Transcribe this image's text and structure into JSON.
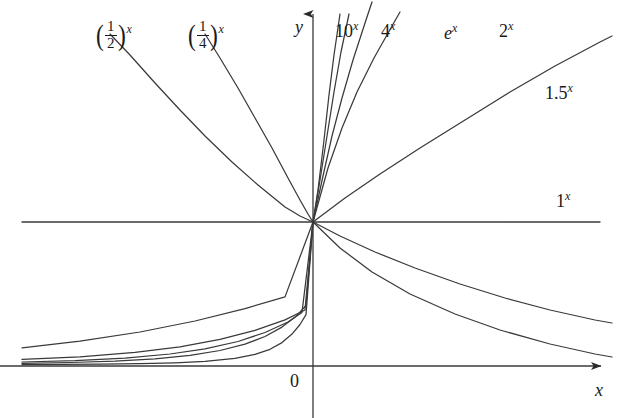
{
  "figure": {
    "title": "",
    "background": "#ffffff",
    "curve_color": "#3a3a3a",
    "axis_color": "#3a3a3a",
    "text_color": "#1a1a1a"
  },
  "axes": {
    "x_axis_label": "x",
    "y_axis_label": "y",
    "origin_label": "0",
    "origin_px": {
      "x": 313,
      "y": 222
    },
    "x_axis_y_px": 366,
    "y_axis_x_px": 313,
    "x_axis_arrow_tip_px": 601,
    "y_axis_arrow_tip_px": 14
  },
  "labels": {
    "half": {
      "base_num": "1",
      "base_den": "2",
      "exponent": "x"
    },
    "quarter": {
      "base_num": "1",
      "base_den": "4",
      "exponent": "x"
    },
    "ten": {
      "base": "10",
      "exponent": "x"
    },
    "four": {
      "base": "4",
      "exponent": "x"
    },
    "e": {
      "base": "e",
      "exponent": "x"
    },
    "two": {
      "base": "2",
      "exponent": "x"
    },
    "onefive": {
      "base": "1.5",
      "exponent": "x"
    },
    "one": {
      "base": "1",
      "exponent": "x"
    }
  },
  "chart_data": {
    "type": "line",
    "title": "",
    "xlabel": "x",
    "ylabel": "y",
    "grid": false,
    "legend": "inline-curve-labels",
    "xlim": [
      -3.1,
      3.1
    ],
    "ylim": [
      -0.25,
      6.5
    ],
    "passes_through": {
      "x": 0,
      "y": 1
    },
    "series": [
      {
        "name": "(1/2)^x",
        "base": 0.5,
        "kind": "decay",
        "label": "(1/2)^x",
        "label_px": {
          "x": 95,
          "y": 22
        }
      },
      {
        "name": "(1/4)^x",
        "base": 0.25,
        "kind": "decay",
        "label": "(1/4)^x",
        "label_px": {
          "x": 187,
          "y": 22
        }
      },
      {
        "name": "10^x",
        "base": 10,
        "kind": "growth",
        "label": "10^x",
        "label_px": {
          "x": 335,
          "y": 22
        }
      },
      {
        "name": "4^x",
        "base": 4,
        "kind": "growth",
        "label": "4^x",
        "label_px": {
          "x": 381,
          "y": 22
        }
      },
      {
        "name": "e^x",
        "base": 2.718281828,
        "kind": "growth",
        "label": "e^x",
        "label_px": {
          "x": 444,
          "y": 22
        }
      },
      {
        "name": "2^x",
        "base": 2,
        "kind": "growth",
        "label": "2^x",
        "label_px": {
          "x": 499,
          "y": 22
        }
      },
      {
        "name": "1.5^x",
        "base": 1.5,
        "kind": "growth",
        "label": "1.5^x",
        "label_px": {
          "x": 545,
          "y": 84
        }
      },
      {
        "name": "1^x",
        "base": 1,
        "kind": "constant",
        "label": "1^x",
        "label_px": {
          "x": 556,
          "y": 192
        }
      }
    ],
    "curve_paths": {
      "ten": "M 22,364.6 L 60,364.4 L 100,364.2 L 140,363.7 L 175,362.8 L 205,361.4 L 235,358.3 L 255,354.4 L 270,349.3 L 282,342.6 L 292,334.1 L 300,324.5 L 306,314.6 L 313,222 L 318,190 L 324,140 L 329,95 L 334,55 L 340,14",
      "four": "M 22,363.3 L 70,362.5 L 115,361.2 L 155,358.9 L 190,355.4 L 220,350.5 L 245,344.2 L 265,336.5 L 282,327.1 L 296,316.3 L 306,305.5 L 313,222 L 320,180 L 327,136 L 334,92 L 341,52 L 349,14",
      "e": "M 22,362.0 L 75,360.6 L 125,358.1 L 170,354.0 L 205,348.8 L 238,341.5 L 265,332.5 L 288,322.0 L 302,312.4 L 313,222 L 323,176 L 332,136 L 342,98 L 353,60 L 366,20 L 372,2",
      "two": "M 22,359.4 L 80,356.8 L 135,352.4 L 180,346.8 L 220,339.4 L 255,330.3 L 285,319.9 L 305,310.0 L 313,222 L 328,168 L 342,128 L 357,92 L 374,58 L 392,26 L 400,12",
      "onefive": "M 22,347.8 L 80,341.2 L 140,332.0 L 195,321.0 L 245,308.6 L 285,296.9 L 313,222 L 345,198 L 380,174 L 420,148 L 465,120 L 510,92 L 555,66 L 600,42 L 612,36",
      "one": "M 22,222 L 313,222 L 600,222",
      "half": "M 110,34 L 130,55 L 155,83 L 180,110 L 205,136 L 232,162 L 258,185 L 285,207 L 300,216 L 313,222 L 340,236 L 375,252 L 415,268 L 460,284 L 505,298 L 550,310 L 595,320 L 612,323",
      "quarter": "M 205,34 L 220,58 L 238,88 L 255,118 L 272,148 L 288,178 L 300,200 L 308,214 L 313,222 L 340,248 L 372,272 L 410,294 L 455,314 L 500,330 L 550,344 L 595,354 L 612,357"
    }
  }
}
